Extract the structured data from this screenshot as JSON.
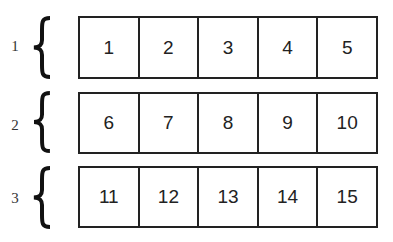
{
  "groups": [
    {
      "label": "1",
      "cells": [
        "1",
        "2",
        "3",
        "4",
        "5"
      ]
    },
    {
      "label": "2",
      "cells": [
        "6",
        "7",
        "8",
        "9",
        "10"
      ]
    },
    {
      "label": "3",
      "cells": [
        "11",
        "12",
        "13",
        "14",
        "15"
      ]
    }
  ]
}
